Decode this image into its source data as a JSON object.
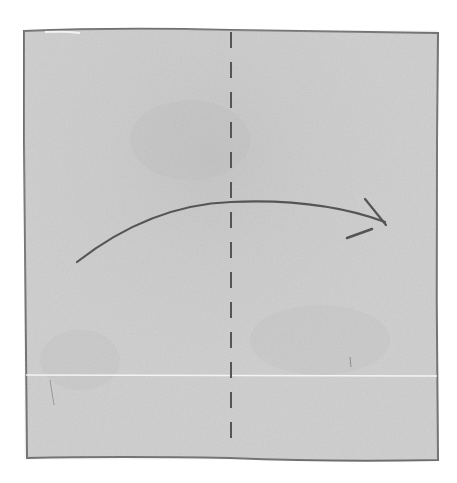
{
  "diagram": {
    "type": "origami-fold-step",
    "colors": {
      "background": "#ffffff",
      "paper": "#cfcfcf",
      "paper_edge": "#6e6e6e",
      "stroke": "#5a5a5a",
      "crease_highlight": "#f4f4f4"
    },
    "elements": {
      "paper": {
        "shape": "square",
        "x": 24,
        "y": 30,
        "width": 414,
        "height": 430
      },
      "fold_line": {
        "style": "dashed",
        "orientation": "vertical",
        "x": 231,
        "y1": 32,
        "y2": 447
      },
      "arrow": {
        "style": "curved",
        "direction": "left-to-right",
        "start": [
          77,
          262
        ],
        "end": [
          385,
          222
        ]
      },
      "crease": {
        "style": "light-line",
        "orientation": "horizontal",
        "y": 375
      }
    }
  }
}
